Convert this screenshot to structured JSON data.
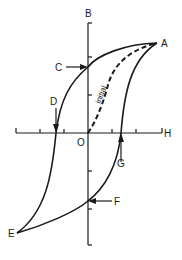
{
  "diagram": {
    "type": "hysteresis-loop",
    "colors": {
      "stroke": "#1a1a1a",
      "background": "#ffffff"
    },
    "axes": {
      "vertical_label": "B",
      "horizontal_label": "H",
      "origin_label": "O"
    },
    "curve_labels": {
      "initial": "initial"
    },
    "points": [
      {
        "id": "A",
        "label": "A",
        "description": "positive saturation"
      },
      {
        "id": "B",
        "label": "B",
        "description": "flux density axis"
      },
      {
        "id": "C",
        "label": "C",
        "description": "positive remanence"
      },
      {
        "id": "D",
        "label": "D",
        "description": "negative coercivity"
      },
      {
        "id": "E",
        "label": "E",
        "description": "negative saturation"
      },
      {
        "id": "F",
        "label": "F",
        "description": "negative remanence"
      },
      {
        "id": "G",
        "label": "G",
        "description": "positive coercivity"
      }
    ],
    "h_axis_ticks": 6,
    "b_axis_ticks": 4
  }
}
